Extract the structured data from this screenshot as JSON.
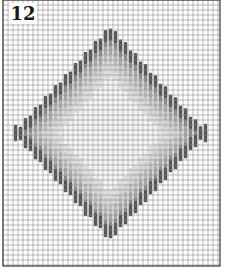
{
  "figure": {
    "number_label": "12"
  },
  "grid": {
    "left": 3,
    "top": 0,
    "right": 220,
    "bottom": 266,
    "cell": 5,
    "line_color": "#8c8c8c",
    "border_color": "#3a3a3a"
  },
  "pattern": {
    "shape": "diamond",
    "center_x": 110,
    "center_y": 133,
    "half_width": 98,
    "half_height": 108,
    "stitch_length": 12,
    "rings": [
      {
        "offset": 0,
        "color": "#555555"
      },
      {
        "offset": 8,
        "color": "#8a8a8a"
      },
      {
        "offset": 16,
        "color": "#a8a8a8"
      },
      {
        "offset": 24,
        "color": "#bdbdbd"
      },
      {
        "offset": 32,
        "color": "#cfcfcf"
      },
      {
        "offset": 40,
        "color": "#dedede"
      }
    ],
    "center_color": "#f4f4f4"
  }
}
